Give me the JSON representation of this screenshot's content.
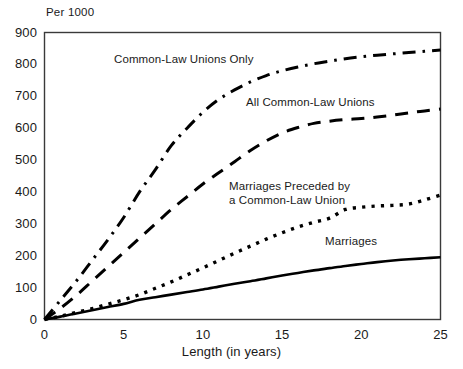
{
  "chart_data": {
    "type": "line",
    "title": "",
    "subtitle": "",
    "unit_label": "Per 1000",
    "xlabel": "Length (in years)",
    "ylabel": "",
    "xlim": [
      0,
      25
    ],
    "ylim": [
      0,
      900
    ],
    "grid": false,
    "legend_position": "inline-annotations",
    "xticks": [
      "0",
      "5",
      "10",
      "15",
      "20",
      "25"
    ],
    "xtick_values": [
      0,
      5,
      10,
      15,
      20,
      25
    ],
    "yticks": [
      "0",
      "100",
      "200",
      "300",
      "400",
      "500",
      "600",
      "700",
      "800",
      "900"
    ],
    "ytick_values": [
      0,
      100,
      200,
      300,
      400,
      500,
      600,
      700,
      800,
      900
    ],
    "x": [
      0,
      1,
      2,
      3,
      4,
      5,
      6,
      7,
      8,
      9,
      10,
      11,
      12,
      13,
      14,
      15,
      16,
      17,
      18,
      19,
      20,
      21,
      22,
      23,
      24,
      25
    ],
    "series": [
      {
        "name": "Common-Law Unions Only",
        "style": "dash-dot",
        "color": "#000000",
        "values": [
          0,
          60,
          120,
          185,
          250,
          320,
          400,
          470,
          545,
          600,
          650,
          690,
          720,
          745,
          765,
          780,
          792,
          802,
          810,
          818,
          824,
          829,
          833,
          837,
          841,
          845
        ]
      },
      {
        "name": "All Common-Law Unions",
        "style": "dashed",
        "color": "#000000",
        "values": [
          0,
          35,
          75,
          120,
          165,
          210,
          255,
          300,
          345,
          385,
          425,
          460,
          495,
          530,
          560,
          585,
          602,
          615,
          622,
          627,
          630,
          635,
          641,
          648,
          654,
          660
        ]
      },
      {
        "name": "Marriages Preceded by a Common-Law Union",
        "style": "dotted",
        "color": "#000000",
        "values": [
          0,
          10,
          22,
          34,
          48,
          62,
          78,
          98,
          118,
          140,
          162,
          185,
          208,
          230,
          252,
          272,
          290,
          305,
          318,
          345,
          352,
          356,
          358,
          362,
          375,
          390
        ]
      },
      {
        "name": "Marriages",
        "style": "solid",
        "color": "#000000",
        "values": [
          0,
          9,
          19,
          29,
          39,
          49,
          62,
          70,
          78,
          86,
          94,
          103,
          112,
          120,
          129,
          138,
          146,
          154,
          161,
          168,
          174,
          180,
          185,
          189,
          192,
          195
        ]
      }
    ],
    "annotations": [
      {
        "text": "Common-Law Unions Only",
        "at_x": 5.5,
        "at_y": 780
      },
      {
        "text": "All Common-Law Unions",
        "at_x": 14,
        "at_y": 650
      },
      {
        "text": "Marriages Preceded by",
        "at_x": 12.5,
        "at_y": 420
      },
      {
        "text": "a Common-Law Union",
        "at_x": 12.5,
        "at_y": 390
      },
      {
        "text": "Marriages",
        "at_x": 19,
        "at_y": 250
      }
    ]
  },
  "axis": {
    "unit_label": "Per 1000",
    "x_title": "Length (in years)"
  }
}
